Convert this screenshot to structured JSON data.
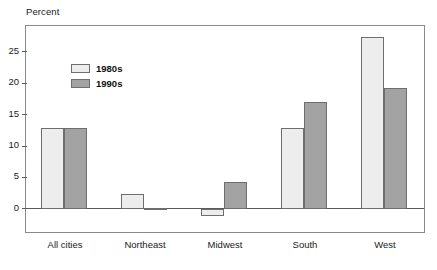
{
  "chart_data": {
    "type": "bar",
    "title": "",
    "subtitle": "",
    "xlabel": "",
    "ylabel": "Percent",
    "categories": [
      "All cities",
      "Northeast",
      "Midwest",
      "South",
      "West"
    ],
    "series": [
      {
        "name": "1980s",
        "color": "#ededed",
        "values": [
          12.8,
          2.3,
          -1.2,
          12.8,
          27.3
        ]
      },
      {
        "name": "1990s",
        "color": "#a3a3a3",
        "values": [
          12.8,
          0.1,
          4.3,
          17.0,
          19.3
        ]
      }
    ],
    "ylim": [
      -4.0,
      29.1
    ],
    "yticks": [
      0,
      5,
      10,
      15,
      20,
      25
    ],
    "ytick_labels": [
      "0",
      "5",
      "10",
      "15",
      "20",
      "25"
    ],
    "grid": false,
    "legend_position": "top-left",
    "zero_line": 0
  },
  "legend": {
    "items": [
      {
        "label": "1980s",
        "swatch": "light-gray-swatch"
      },
      {
        "label": "1990s",
        "swatch": "dark-gray-swatch"
      }
    ]
  },
  "axis": {
    "y_title": "Percent"
  },
  "footnote": {
    "text": ""
  },
  "colors": {
    "series_1980s": "#ededed",
    "series_1990s": "#a3a3a3",
    "bar_border": "#6e6e6e",
    "frame": "#8a8a8a",
    "axis": "#5a5a5a",
    "text": "#1a1a1a",
    "background": "#ffffff"
  }
}
